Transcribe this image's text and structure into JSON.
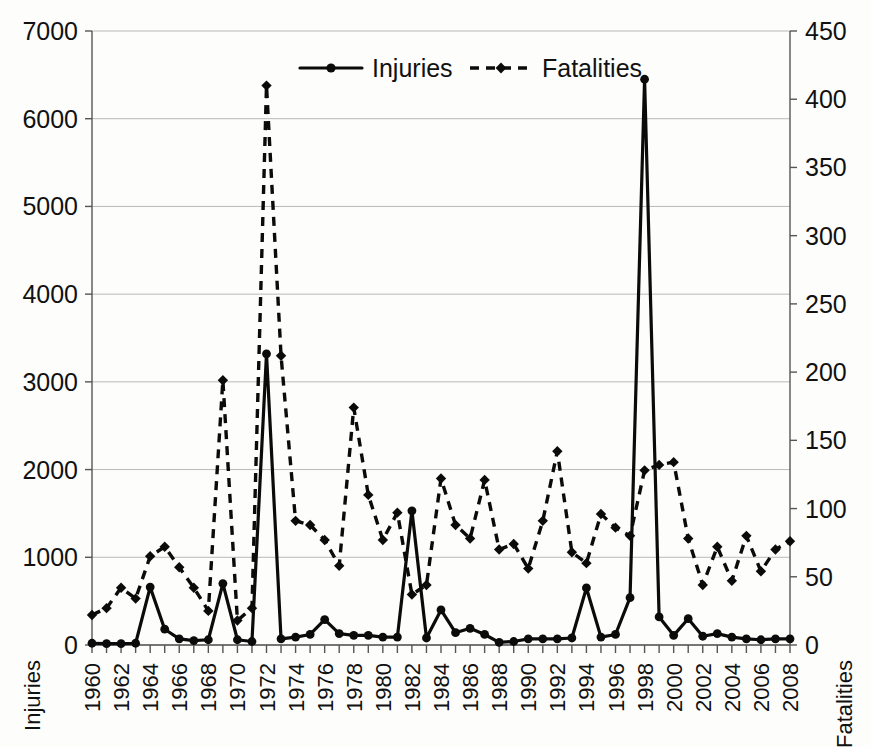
{
  "chart_data": {
    "type": "line",
    "title": "",
    "xlabel": "",
    "ylabel": "Injuries",
    "y2label": "Fatalities",
    "grid": true,
    "legend_position": "top-center",
    "x": [
      1960,
      1961,
      1962,
      1963,
      1964,
      1965,
      1966,
      1967,
      1968,
      1969,
      1970,
      1971,
      1972,
      1973,
      1974,
      1975,
      1976,
      1977,
      1978,
      1979,
      1980,
      1981,
      1982,
      1983,
      1984,
      1985,
      1986,
      1987,
      1988,
      1989,
      1990,
      1991,
      1992,
      1993,
      1994,
      1995,
      1996,
      1997,
      1998,
      1999,
      2000,
      2001,
      2002,
      2003,
      2004,
      2005,
      2006,
      2007,
      2008
    ],
    "xtick_labels": [
      "1960",
      "1962",
      "1964",
      "1966",
      "1968",
      "1970",
      "1972",
      "1974",
      "1976",
      "1978",
      "1980",
      "1982",
      "1984",
      "1986",
      "1988",
      "1990",
      "1992",
      "1994",
      "1996",
      "1998",
      "2000",
      "2002",
      "2004",
      "2006",
      "2008"
    ],
    "ylim": [
      0,
      7000
    ],
    "yticks": [
      0,
      1000,
      2000,
      3000,
      4000,
      5000,
      6000,
      7000
    ],
    "ytick_labels": [
      "0",
      "1000",
      "2000",
      "3000",
      "4000",
      "5000",
      "6000",
      "7000"
    ],
    "y2lim": [
      0,
      450
    ],
    "y2ticks": [
      0,
      50,
      100,
      150,
      200,
      250,
      300,
      350,
      400,
      450
    ],
    "y2tick_labels": [
      "0",
      "50",
      "100",
      "150",
      "200",
      "250",
      "300",
      "350",
      "400",
      "450"
    ],
    "series": [
      {
        "name": "Injuries",
        "axis": "left",
        "style": "solid",
        "marker": "circle",
        "values": [
          20,
          15,
          15,
          20,
          660,
          180,
          70,
          50,
          60,
          700,
          60,
          40,
          3320,
          70,
          90,
          120,
          290,
          130,
          110,
          110,
          90,
          90,
          1530,
          80,
          400,
          140,
          190,
          120,
          30,
          40,
          70,
          70,
          70,
          80,
          650,
          90,
          120,
          540,
          6450,
          320,
          110,
          300,
          100,
          130,
          90,
          70,
          60,
          70,
          70
        ]
      },
      {
        "name": "Fatalities",
        "axis": "right",
        "style": "dashed",
        "marker": "diamond",
        "values": [
          22,
          27,
          42,
          34,
          65,
          72,
          57,
          42,
          25,
          194,
          18,
          27,
          410,
          212,
          91,
          88,
          77,
          58,
          174,
          110,
          77,
          97,
          37,
          44,
          122,
          88,
          78,
          121,
          70,
          74,
          56,
          91,
          142,
          68,
          60,
          96,
          86,
          80,
          128,
          132,
          134,
          78,
          44,
          72,
          47,
          80,
          54,
          70,
          76
        ]
      }
    ]
  },
  "legend": {
    "items": [
      {
        "label": "Injuries",
        "style": "solid",
        "marker": "circle"
      },
      {
        "label": "Fatalities",
        "style": "dashed",
        "marker": "diamond"
      }
    ]
  },
  "axes": {
    "left_title": "Injuries",
    "right_title": "Fatalities"
  },
  "colors": {
    "ink": "#0b0b0b",
    "grid": "#b9b9b9",
    "axis": "#555555",
    "background": "#fdfdfb"
  }
}
